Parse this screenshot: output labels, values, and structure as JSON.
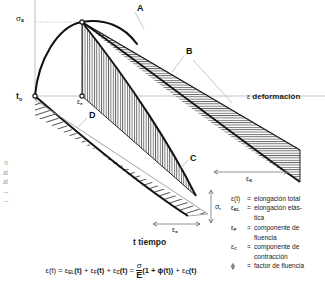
{
  "figure": {
    "title_domain": "creep-shrinkage-strain-diagram",
    "callouts": [
      {
        "id": "A",
        "label": "A",
        "x": 137,
        "y": 5
      },
      {
        "id": "B",
        "label": "B",
        "x": 186,
        "y": 48
      },
      {
        "id": "C",
        "label": "C",
        "x": 190,
        "y": 155
      },
      {
        "id": "D",
        "label": "D",
        "x": 89,
        "y": 112
      }
    ],
    "axis_labels": {
      "sigma_a": {
        "base": "σ",
        "sub": "a",
        "x": 16,
        "y": 17
      },
      "t_o": {
        "base": "t",
        "sub": "o",
        "x": 16,
        "y": 93
      },
      "eps_e": {
        "base": "ε",
        "sub": "e",
        "x": 77,
        "y": 96
      },
      "eps_K": {
        "base": "ε",
        "sub": "K",
        "x": 246,
        "y": 177
      },
      "sigma_r": {
        "base": "σ",
        "sub": "r",
        "x": 215,
        "y": 205
      },
      "eps_a": {
        "base": "ε",
        "sub": "a",
        "x": 177,
        "y": 228
      },
      "deformacion": {
        "symbol": "ε",
        "text": "deformación",
        "x": 247,
        "y": 96
      },
      "tiempo": {
        "symbol": "t",
        "text": "tiempo",
        "x": 140,
        "y": 240
      }
    }
  },
  "legend": {
    "entries": [
      {
        "symbol": "ε(t)",
        "sub": "",
        "equals": "=",
        "text": "elongación total",
        "cont": ""
      },
      {
        "symbol": "ε",
        "sub": "EL",
        "equals": "=",
        "text": "elongación elás-",
        "cont": "tica"
      },
      {
        "symbol": "ε",
        "sub": "F",
        "equals": "=",
        "text": "componente de",
        "cont": "fluencia"
      },
      {
        "symbol": "ε",
        "sub": "C",
        "equals": "=",
        "text": "componente de",
        "cont": "contracción"
      },
      {
        "symbol": "ϕ",
        "sub": "",
        "equals": "=",
        "text": "factor de fluencia",
        "cont": ""
      }
    ]
  },
  "formula": {
    "lhs": "ε(t)",
    "eq1": "=",
    "t1": "ε",
    "t1sub": "EL",
    "t1arg": "(t)",
    "plus1": "+",
    "t2": "ε",
    "t2sub": "F",
    "t2arg": "(t)",
    "plus2": "+",
    "t3": "ε",
    "t3sub": "C",
    "t3arg": "(t)",
    "eq2": "=",
    "frac_num": "σ",
    "frac_den": "E",
    "paren": "(1 + ϕ(t))",
    "plus3": "+",
    "t4": "ε",
    "t4sub": "C",
    "t4arg": "(t)"
  },
  "left_caption": {
    "lines": [
      "n",
      "al",
      "al",
      "–",
      "",
      "–"
    ]
  },
  "colors": {
    "ink": "#1b1b1b",
    "hatch": "#303030",
    "thin_rule": "#9c9c9c",
    "leader": "#b5b5b5",
    "legend_text": "#222222",
    "background": "#ffffff"
  }
}
